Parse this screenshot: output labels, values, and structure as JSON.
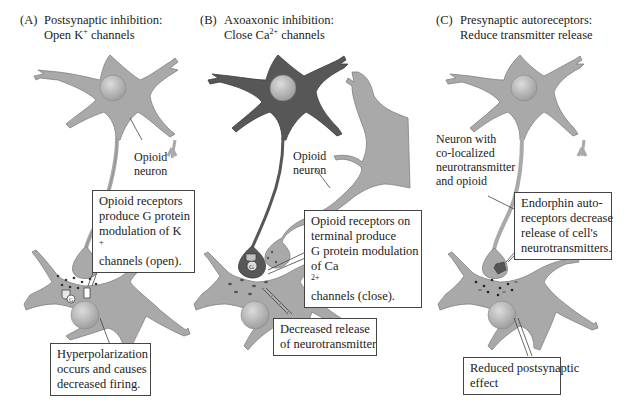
{
  "figure": {
    "colors": {
      "neuron_fill": "#a9a9a9",
      "neuron_dark": "#575757",
      "neuron_edge": "#7a7a7a",
      "nucleus": "#bdbdbd",
      "vesicle": "#333333",
      "box_border": "#444444"
    },
    "panels": [
      {
        "id": "A",
        "title_prefix": "(A)",
        "title_line1": "Postsynaptic inhibition:",
        "title_line2_pre": "Open K",
        "title_line2_sup": "+",
        "title_line2_post": " channels",
        "neuron_label": [
          "Opioid",
          "neuron"
        ],
        "callout": [
          "Opioid receptors",
          "produce G protein",
          "modulation of K",
          "channels (open)."
        ],
        "callout_sup": "+",
        "bottom_callout": [
          "Hyperpolarization",
          "occurs and causes",
          "decreased firing."
        ],
        "g_protein_label": "G"
      },
      {
        "id": "B",
        "title_prefix": "(B)",
        "title_line1": "Axoaxonic inhibition:",
        "title_line2_pre": "Close Ca",
        "title_line2_sup": "2+",
        "title_line2_post": " channels",
        "neuron_label": [
          "Opioid",
          "neuron"
        ],
        "callout": [
          "Opioid receptors on",
          "terminal produce",
          "G protein modulation",
          "of Ca",
          " channels (close)."
        ],
        "callout_sup": "2+",
        "bottom_callout": [
          "Decreased release",
          "of neurotransmitter"
        ],
        "g_protein_label": "G"
      },
      {
        "id": "C",
        "title_prefix": "(C)",
        "title_line1": "Presynaptic autoreceptors:",
        "title_line2_pre": "Reduce transmitter release",
        "title_line2_sup": "",
        "title_line2_post": "",
        "neuron_label": [
          "Neuron with",
          "co-localized",
          "neurotransmitter",
          "and opioid"
        ],
        "callout": [
          "Endorphin auto-",
          "receptors decrease",
          "release of cell's",
          "neurotransmitters."
        ],
        "bottom_callout": [
          "Reduced postsynaptic",
          "effect"
        ]
      }
    ]
  }
}
